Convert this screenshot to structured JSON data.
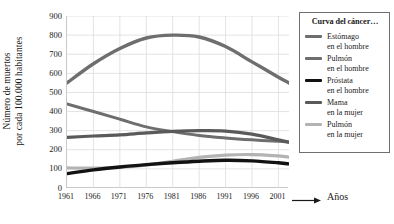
{
  "chart_data": {
    "type": "line",
    "title": "",
    "xlabel": "Años",
    "ylabel_line1": "Número de muertos",
    "ylabel_line2": "por cada 100.000 habitantes",
    "legend_title": "Curva del cáncer…",
    "legend_position": "right",
    "grid": true,
    "xlim": [
      1961,
      2003
    ],
    "ylim": [
      0,
      900
    ],
    "yticks": [
      900,
      800,
      700,
      600,
      500,
      400,
      300,
      200,
      100,
      0
    ],
    "xticks": [
      1961,
      1966,
      1971,
      1976,
      1981,
      1986,
      1991,
      1996,
      2001
    ],
    "x": [
      1961,
      1966,
      1971,
      1976,
      1981,
      1986,
      1991,
      1996,
      2001,
      2003
    ],
    "series": [
      {
        "name": "Estómago",
        "name_line2": "en el hombre",
        "color": "#6e6e6e",
        "width": 3,
        "values": [
          440,
          400,
          360,
          320,
          295,
          275,
          262,
          252,
          244,
          240
        ]
      },
      {
        "name": "Pulmón",
        "name_line2": "en el hombre",
        "color": "#6e6e6e",
        "width": 3.4,
        "values": [
          550,
          650,
          730,
          785,
          800,
          790,
          740,
          660,
          580,
          550
        ]
      },
      {
        "name": "Próstata",
        "name_line2": "en el hombre",
        "color": "#121212",
        "width": 3.4,
        "values": [
          75,
          95,
          110,
          122,
          132,
          140,
          145,
          142,
          132,
          126
        ]
      },
      {
        "name": "Mama",
        "name_line2": "en la mujer",
        "color": "#5a5a5a",
        "width": 3.2,
        "values": [
          265,
          272,
          278,
          288,
          296,
          300,
          298,
          282,
          252,
          240
        ]
      },
      {
        "name": "Pulmón",
        "name_line2": "en la mujer",
        "color": "#b3b3b3",
        "width": 3.2,
        "values": [
          105,
          104,
          108,
          120,
          140,
          160,
          172,
          175,
          168,
          162
        ]
      }
    ],
    "axis_arrow": "arrow-right"
  }
}
